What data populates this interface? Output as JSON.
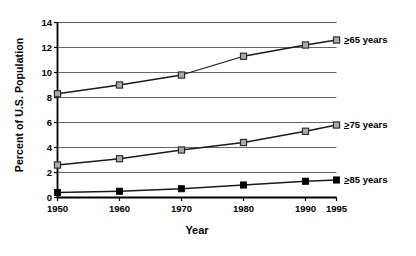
{
  "chart_data": {
    "type": "line",
    "title": "",
    "xlabel": "Year",
    "ylabel": "Percent of U.S. Population",
    "x": [
      1950,
      1960,
      1970,
      1980,
      1990,
      1995
    ],
    "xticklabels": [
      "1950",
      "1960",
      "1970",
      "1980",
      "1990",
      "1995"
    ],
    "yticklabels": [
      "0",
      "2",
      "4",
      "6",
      "8",
      "10",
      "12",
      "14"
    ],
    "yticks": [
      0,
      2,
      4,
      6,
      8,
      10,
      12,
      14
    ],
    "ylim": [
      0,
      14
    ],
    "xlim": [
      1950,
      1995
    ],
    "grid": "horizontal",
    "legend_position": "right-inline",
    "series": [
      {
        "name": "≥65 years",
        "label_prefix": ">",
        "label_rest": "65 years",
        "marker": "open-square",
        "values": [
          8.3,
          9.0,
          9.8,
          11.3,
          12.2,
          12.6
        ]
      },
      {
        "name": "≥75 years",
        "label_prefix": ">",
        "label_rest": "75 years",
        "marker": "open-square",
        "values": [
          2.6,
          3.1,
          3.8,
          4.4,
          5.3,
          5.8
        ]
      },
      {
        "name": "≥85 years",
        "label_prefix": ">",
        "label_rest": "85 years",
        "marker": "filled-square",
        "values": [
          0.4,
          0.5,
          0.7,
          1.0,
          1.3,
          1.4
        ]
      }
    ],
    "colors": {
      "line": "#1a1a1a",
      "grid": "#555555",
      "axis": "#000000",
      "marker_open_fill": "#a9a9a9",
      "marker_filled": "#000000",
      "background": "#ffffff"
    }
  },
  "axes": {
    "ylabel": "Percent of U.S. Population",
    "xlabel": "Year",
    "yticks": [
      "14",
      "12",
      "10",
      "8",
      "6",
      "4",
      "2",
      "0"
    ],
    "xticks": [
      "1950",
      "1960",
      "1970",
      "1980",
      "1990",
      "1995"
    ]
  },
  "legend": {
    "items": [
      {
        "prefix": ">",
        "text": "65 years"
      },
      {
        "prefix": ">",
        "text": "75 years"
      },
      {
        "prefix": ">",
        "text": "85 years"
      }
    ]
  }
}
